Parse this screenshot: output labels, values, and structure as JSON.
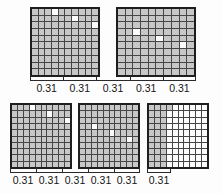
{
  "figure": {
    "type": "decimal-hundredths-grid-model",
    "unit_label": "0.31",
    "group_size_hundredths": 31,
    "total_groups": 11,
    "total_value_modeled": "3.41"
  },
  "colors": {
    "shaded_cell": "#c7c7c7",
    "unshaded_cell": "#fcfcfc",
    "grid_line": "#454545",
    "grid_frame": "#1e1e1e",
    "bracket": "#2a2a2a",
    "label_text": "#141414"
  },
  "grids": [
    {
      "name": "grid-1",
      "rows": 10,
      "columns": 10,
      "shaded_count": 100,
      "white_cells": [
        31,
        62,
        93
      ]
    },
    {
      "name": "grid-2",
      "rows": 10,
      "columns": 10,
      "shaded_count": 100,
      "white_cells": [
        24,
        55,
        86
      ]
    },
    {
      "name": "grid-3",
      "rows": 10,
      "columns": 10,
      "shaded_count": 100,
      "white_cells": [
        31,
        62,
        93
      ]
    },
    {
      "name": "grid-4",
      "rows": 10,
      "columns": 10,
      "shaded_count": 100,
      "white_cells": [
        24,
        55,
        86
      ]
    },
    {
      "name": "grid-5",
      "rows": 10,
      "columns": 10,
      "shaded_count": 31,
      "white_cells": []
    }
  ],
  "top_bracket": {
    "segments": 5,
    "labels": [
      "0.31",
      "0.31",
      "0.31",
      "0.31",
      "0.31"
    ]
  },
  "bottom_bracket": {
    "segments": 5,
    "labels": [
      "0.31",
      "0.31",
      "0.31",
      "0.31",
      "0.31"
    ]
  },
  "short_bracket": {
    "segments": 1,
    "labels": [
      "0.31"
    ]
  }
}
